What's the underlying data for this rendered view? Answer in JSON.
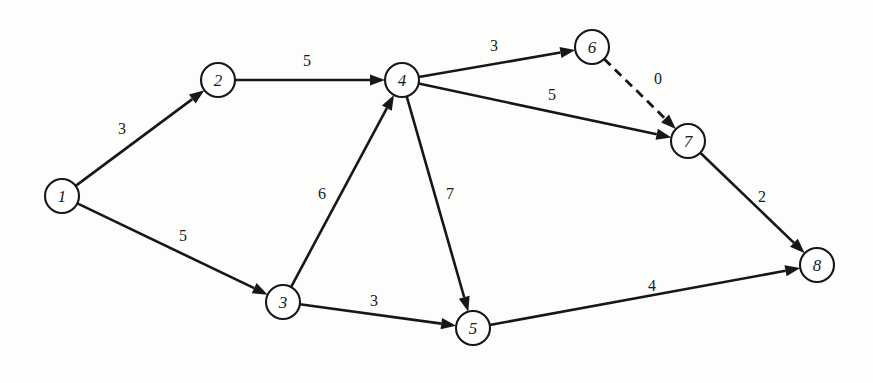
{
  "figure": {
    "name": "directed-weighted-network-graph",
    "background_color": "#fdfdfc",
    "line_color": "#17161a",
    "node_fill": "#ffffff"
  },
  "chart_data": {
    "type": "diagram",
    "subtype": "directed-weighted-graph",
    "title": "",
    "xlabel": "",
    "ylabel": "",
    "grid": false,
    "legend": "none",
    "node_radius": 17,
    "canvas": {
      "width": 873,
      "height": 383
    },
    "nodes": [
      {
        "id": "1",
        "label": "1",
        "x": 62,
        "y": 196
      },
      {
        "id": "2",
        "label": "2",
        "x": 218,
        "y": 80
      },
      {
        "id": "3",
        "label": "3",
        "x": 283,
        "y": 302
      },
      {
        "id": "4",
        "label": "4",
        "x": 402,
        "y": 80
      },
      {
        "id": "5",
        "label": "5",
        "x": 473,
        "y": 328
      },
      {
        "id": "6",
        "label": "6",
        "x": 592,
        "y": 47
      },
      {
        "id": "7",
        "label": "7",
        "x": 688,
        "y": 141
      },
      {
        "id": "8",
        "label": "8",
        "x": 817,
        "y": 265
      }
    ],
    "edges": [
      {
        "from": "1",
        "to": "2",
        "weight": "3",
        "style": "solid",
        "label_x": 122,
        "label_y": 128
      },
      {
        "from": "1",
        "to": "3",
        "weight": "5",
        "style": "solid",
        "label_x": 183,
        "label_y": 235
      },
      {
        "from": "2",
        "to": "4",
        "weight": "5",
        "style": "solid",
        "label_x": 307,
        "label_y": 60
      },
      {
        "from": "3",
        "to": "4",
        "weight": "6",
        "style": "solid",
        "label_x": 322,
        "label_y": 193
      },
      {
        "from": "3",
        "to": "5",
        "weight": "3",
        "style": "solid",
        "label_x": 374,
        "label_y": 300
      },
      {
        "from": "4",
        "to": "5",
        "weight": "7",
        "style": "solid",
        "label_x": 450,
        "label_y": 193
      },
      {
        "from": "4",
        "to": "6",
        "weight": "3",
        "style": "solid",
        "label_x": 494,
        "label_y": 45
      },
      {
        "from": "4",
        "to": "7",
        "weight": "5",
        "style": "solid",
        "label_x": 552,
        "label_y": 94
      },
      {
        "from": "5",
        "to": "8",
        "weight": "4",
        "style": "solid",
        "label_x": 652,
        "label_y": 285
      },
      {
        "from": "6",
        "to": "7",
        "weight": "0",
        "style": "dashed",
        "label_x": 658,
        "label_y": 78
      },
      {
        "from": "7",
        "to": "8",
        "weight": "2",
        "style": "solid",
        "label_x": 762,
        "label_y": 196
      }
    ]
  }
}
